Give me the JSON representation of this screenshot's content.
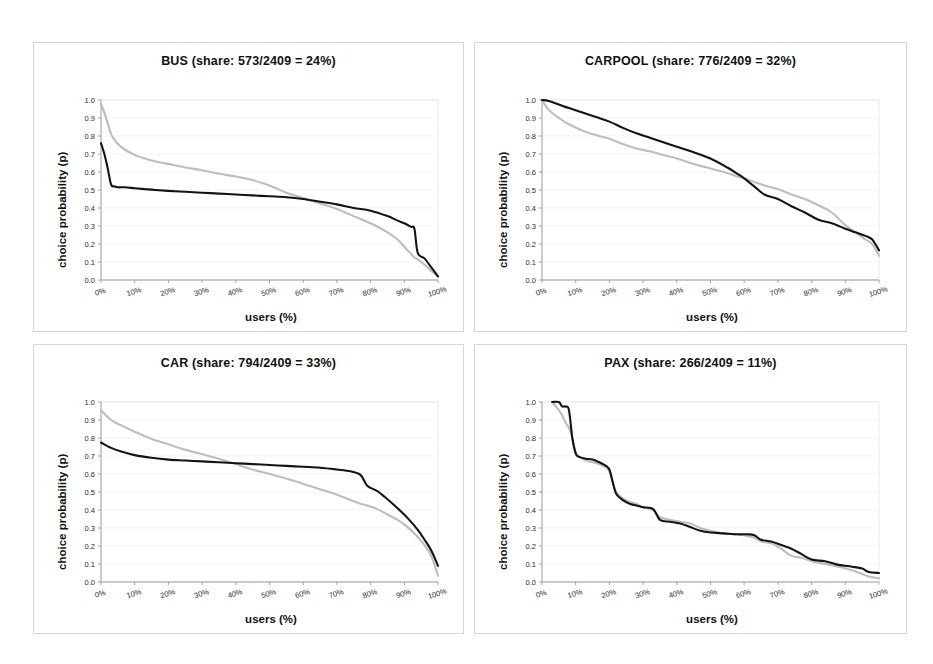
{
  "figure": {
    "background": "#ffffff",
    "panel_border_color": "#d6d6d6",
    "series_colors": {
      "observed": "#141414",
      "predicted": "#bdbdbd"
    },
    "total_respondents": 2409
  },
  "panels": [
    {
      "key": "bus",
      "title": "BUS (share: 573/2409 = 24%)",
      "mode": "BUS",
      "share_count": "573",
      "share_total": "2409",
      "share_pct": "24%",
      "xlabel": "users (%)",
      "ylabel": "choice probability (p)"
    },
    {
      "key": "carpool",
      "title": "CARPOOL (share: 776/2409 = 32%)",
      "mode": "CARPOOL",
      "share_count": "776",
      "share_total": "2409",
      "share_pct": "32%",
      "xlabel": "users (%)",
      "ylabel": "choice probability (p)"
    },
    {
      "key": "car",
      "title": "CAR (share: 794/2409 = 33%)",
      "mode": "CAR",
      "share_count": "794",
      "share_total": "2409",
      "share_pct": "33%",
      "xlabel": "users (%)",
      "ylabel": "choice probability (p)"
    },
    {
      "key": "pax",
      "title": "PAX (share: 266/2409 = 11%)",
      "mode": "PAX",
      "share_count": "266",
      "share_total": "2409",
      "share_pct": "11%",
      "xlabel": "users (%)",
      "ylabel": "choice probability (p)"
    }
  ],
  "axes": {
    "ytick_labels": [
      "1.0",
      "0.9",
      "0.8",
      "0.7",
      "0.6",
      "0.5",
      "0.4",
      "0.3",
      "0.2",
      "0.1",
      "0.0"
    ],
    "ytick_values": [
      1.0,
      0.9,
      0.8,
      0.7,
      0.6,
      0.5,
      0.4,
      0.3,
      0.2,
      0.1,
      0.0
    ],
    "xtick_labels": [
      "0%",
      "10%",
      "20%",
      "30%",
      "40%",
      "50%",
      "60%",
      "70%",
      "80%",
      "90%",
      "100%"
    ],
    "xtick_values": [
      0,
      10,
      20,
      30,
      40,
      50,
      60,
      70,
      80,
      90,
      100
    ],
    "ylim": [
      0,
      1
    ],
    "xlim": [
      0,
      100
    ]
  },
  "chart_data": [
    {
      "type": "line",
      "panel": "bus",
      "title": "BUS (share: 573/2409 = 24%)",
      "xlabel": "users (%)",
      "ylabel": "choice probability (p)",
      "xlim": [
        0,
        100
      ],
      "ylim": [
        0,
        1
      ],
      "grid": true,
      "legend": "none",
      "x": [
        0,
        1,
        2,
        3,
        4,
        5,
        7,
        10,
        13,
        16,
        20,
        25,
        30,
        35,
        40,
        45,
        50,
        55,
        60,
        65,
        70,
        75,
        80,
        85,
        88,
        90,
        92,
        93,
        94,
        96,
        98,
        100
      ],
      "series": [
        {
          "name": "observed",
          "color": "#141414",
          "values": [
            0.76,
            0.7,
            0.62,
            0.53,
            0.52,
            0.515,
            0.515,
            0.51,
            0.505,
            0.5,
            0.495,
            0.49,
            0.485,
            0.48,
            0.475,
            0.47,
            0.465,
            0.46,
            0.45,
            0.435,
            0.42,
            0.4,
            0.385,
            0.355,
            0.33,
            0.315,
            0.295,
            0.285,
            0.15,
            0.12,
            0.07,
            0.02
          ]
        },
        {
          "name": "predicted",
          "color": "#bdbdbd",
          "values": [
            0.98,
            0.93,
            0.87,
            0.81,
            0.78,
            0.755,
            0.725,
            0.695,
            0.675,
            0.66,
            0.645,
            0.625,
            0.61,
            0.59,
            0.575,
            0.555,
            0.525,
            0.485,
            0.455,
            0.425,
            0.395,
            0.355,
            0.315,
            0.265,
            0.225,
            0.185,
            0.145,
            0.125,
            0.115,
            0.085,
            0.05,
            0.02
          ]
        }
      ]
    },
    {
      "type": "line",
      "panel": "carpool",
      "title": "CARPOOL (share: 776/2409 = 32%)",
      "xlabel": "users (%)",
      "ylabel": "choice probability (p)",
      "xlim": [
        0,
        100
      ],
      "ylim": [
        0,
        1
      ],
      "grid": true,
      "legend": "none",
      "x": [
        0,
        2,
        5,
        8,
        12,
        16,
        20,
        24,
        28,
        32,
        36,
        40,
        45,
        50,
        55,
        58,
        60,
        63,
        66,
        70,
        74,
        78,
        82,
        86,
        90,
        93,
        96,
        98,
        100
      ],
      "series": [
        {
          "name": "observed",
          "color": "#141414",
          "values": [
            1.0,
            0.995,
            0.975,
            0.955,
            0.93,
            0.905,
            0.88,
            0.845,
            0.815,
            0.79,
            0.765,
            0.74,
            0.71,
            0.675,
            0.625,
            0.59,
            0.565,
            0.52,
            0.475,
            0.45,
            0.41,
            0.375,
            0.335,
            0.315,
            0.285,
            0.265,
            0.245,
            0.225,
            0.165
          ]
        },
        {
          "name": "predicted",
          "color": "#bdbdbd",
          "values": [
            1.0,
            0.945,
            0.9,
            0.865,
            0.83,
            0.805,
            0.785,
            0.755,
            0.73,
            0.715,
            0.695,
            0.675,
            0.645,
            0.62,
            0.595,
            0.575,
            0.565,
            0.545,
            0.525,
            0.505,
            0.475,
            0.45,
            0.415,
            0.375,
            0.305,
            0.265,
            0.225,
            0.2,
            0.135
          ]
        }
      ]
    },
    {
      "type": "line",
      "panel": "car",
      "title": "CAR (share: 794/2409 = 33%)",
      "xlabel": "users (%)",
      "ylabel": "choice probability (p)",
      "xlim": [
        0,
        100
      ],
      "ylim": [
        0,
        1
      ],
      "grid": true,
      "legend": "none",
      "x": [
        0,
        3,
        6,
        10,
        15,
        20,
        25,
        30,
        35,
        40,
        45,
        50,
        55,
        60,
        65,
        70,
        74,
        77,
        79,
        82,
        85,
        88,
        91,
        94,
        96,
        98,
        100
      ],
      "series": [
        {
          "name": "observed",
          "color": "#141414",
          "values": [
            0.775,
            0.745,
            0.725,
            0.705,
            0.69,
            0.68,
            0.675,
            0.67,
            0.665,
            0.66,
            0.655,
            0.65,
            0.645,
            0.64,
            0.635,
            0.625,
            0.615,
            0.595,
            0.535,
            0.505,
            0.46,
            0.41,
            0.355,
            0.29,
            0.235,
            0.175,
            0.09
          ]
        },
        {
          "name": "predicted",
          "color": "#bdbdbd",
          "values": [
            0.955,
            0.9,
            0.87,
            0.835,
            0.795,
            0.765,
            0.735,
            0.71,
            0.685,
            0.655,
            0.625,
            0.6,
            0.575,
            0.545,
            0.515,
            0.485,
            0.455,
            0.435,
            0.425,
            0.405,
            0.375,
            0.345,
            0.305,
            0.25,
            0.205,
            0.145,
            0.035
          ]
        }
      ]
    },
    {
      "type": "line",
      "panel": "pax",
      "title": "PAX (share: 266/2409 = 11%)",
      "xlabel": "users (%)",
      "ylabel": "choice probability (p)",
      "xlim": [
        0,
        100
      ],
      "ylim": [
        0,
        1
      ],
      "grid": true,
      "legend": "none",
      "x": [
        3,
        5,
        6,
        7,
        8,
        9,
        10,
        11,
        13,
        15,
        17,
        19,
        20,
        21,
        22,
        24,
        26,
        28,
        30,
        33,
        35,
        38,
        41,
        44,
        47,
        50,
        54,
        58,
        61,
        63,
        65,
        68,
        71,
        74,
        77,
        80,
        84,
        88,
        92,
        95,
        97,
        100
      ],
      "series": [
        {
          "name": "observed",
          "color": "#141414",
          "values": [
            1.0,
            1.0,
            0.975,
            0.975,
            0.955,
            0.8,
            0.715,
            0.695,
            0.685,
            0.68,
            0.665,
            0.645,
            0.625,
            0.555,
            0.49,
            0.455,
            0.435,
            0.425,
            0.415,
            0.405,
            0.345,
            0.335,
            0.325,
            0.305,
            0.285,
            0.275,
            0.27,
            0.265,
            0.265,
            0.26,
            0.235,
            0.225,
            0.205,
            0.185,
            0.155,
            0.125,
            0.115,
            0.095,
            0.085,
            0.075,
            0.055,
            0.05
          ]
        },
        {
          "name": "predicted",
          "color": "#bdbdbd",
          "values": [
            1.0,
            0.955,
            0.925,
            0.885,
            0.855,
            0.8,
            0.715,
            0.695,
            0.675,
            0.665,
            0.655,
            0.635,
            0.615,
            0.55,
            0.5,
            0.465,
            0.445,
            0.435,
            0.415,
            0.4,
            0.36,
            0.345,
            0.335,
            0.325,
            0.3,
            0.285,
            0.27,
            0.265,
            0.255,
            0.245,
            0.225,
            0.215,
            0.185,
            0.145,
            0.135,
            0.115,
            0.1,
            0.085,
            0.065,
            0.045,
            0.03,
            0.02
          ]
        }
      ]
    }
  ]
}
